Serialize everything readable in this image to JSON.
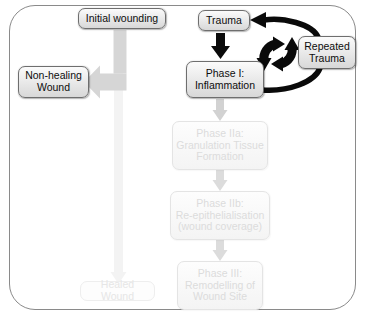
{
  "diagram": {
    "colors": {
      "frame_border": "#8a8a8a",
      "node_border": "#6e6e6e",
      "node_fill_top": "#fbfbfb",
      "node_fill_bottom": "#d8d8d8",
      "node_text": "#0d0d0d",
      "arrow_dark": "#0a0a0a",
      "arrow_grey": "#c9c9c9",
      "arrow_faint": "#efefef",
      "ghost_text": "#dcdcdc"
    },
    "nodes": {
      "initial_wounding": {
        "label": "Initial wounding",
        "state": "active"
      },
      "trauma": {
        "label": "Trauma",
        "state": "active"
      },
      "repeated_trauma": {
        "line1": "Repeated",
        "line2": "Trauma",
        "state": "active"
      },
      "non_healing_wound": {
        "line1": "Non-healing",
        "line2": "Wound",
        "state": "active"
      },
      "phase_i": {
        "line1": "Phase I:",
        "line2": "Inflammation",
        "state": "active"
      },
      "phase_iia": {
        "line1": "Phase IIa:",
        "line2": "Granulation Tissue",
        "line3": "Formation",
        "state": "faded"
      },
      "phase_iib": {
        "line1": "Phase IIb:",
        "line2": "Re-epithelialisation",
        "line3": "(wound coverage)",
        "state": "faded"
      },
      "phase_iii": {
        "line1": "Phase III:",
        "line2": "Remodelling of",
        "line3": "Wound Site",
        "state": "faded"
      },
      "healed_wound": {
        "label": "Healed Wound",
        "state": "faded"
      }
    },
    "arrows": [
      {
        "name": "initial-wounding-to-non-healing-wound",
        "style": "grey-bent",
        "from": "initial_wounding",
        "to": "non_healing_wound"
      },
      {
        "name": "initial-wounding-to-healed-wound",
        "style": "faint-vertical",
        "from": "initial_wounding",
        "to": "healed_wound"
      },
      {
        "name": "trauma-to-phase-i",
        "style": "dark-vertical",
        "from": "trauma",
        "to": "phase_i"
      },
      {
        "name": "phase-i-to-phase-iia",
        "style": "grey-vertical",
        "from": "phase_i",
        "to": "phase_iia"
      },
      {
        "name": "phase-iia-to-phase-iib",
        "style": "grey-vertical",
        "from": "phase_iia",
        "to": "phase_iib"
      },
      {
        "name": "phase-iib-to-phase-iii",
        "style": "grey-vertical",
        "from": "phase_iib",
        "to": "phase_iii"
      },
      {
        "name": "phase-i-to-repeated-trauma",
        "style": "dark-curve",
        "from": "phase_i",
        "to": "repeated_trauma"
      },
      {
        "name": "repeated-trauma-to-trauma",
        "style": "dark-curve-arrow",
        "from": "repeated_trauma",
        "to": "trauma"
      }
    ],
    "icons": {
      "recycle_cycle": "recycle-cycle-icon"
    }
  }
}
